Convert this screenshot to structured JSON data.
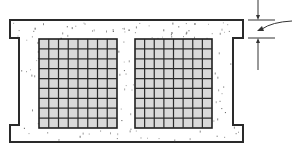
{
  "figure": {
    "title": "",
    "colors": {
      "outline": "#2a2a2a",
      "grid_fill": "#d9d9d9",
      "grid_lines": "#2b2b2b",
      "speckle": "#555555",
      "background": "#ffffff"
    },
    "outline": {
      "points": [
        [
          10,
          20
        ],
        [
          243,
          20
        ],
        [
          243,
          38
        ],
        [
          233,
          38
        ],
        [
          233,
          125
        ],
        [
          243,
          125
        ],
        [
          243,
          142
        ],
        [
          10,
          142
        ],
        [
          10,
          125
        ],
        [
          19,
          125
        ],
        [
          19,
          38
        ],
        [
          10,
          38
        ]
      ]
    },
    "grids": [
      {
        "id": "left-mesh",
        "x": 39,
        "y": 39,
        "width": 78,
        "height": 89,
        "cols": 8,
        "rows": 9
      },
      {
        "id": "right-mesh",
        "x": 135,
        "y": 39,
        "width": 77,
        "height": 89,
        "cols": 8,
        "rows": 9
      }
    ],
    "dimension": {
      "top_line_y": 20,
      "bottom_line_y": 38,
      "x_start": 248,
      "x_end": 275,
      "arrow_x": 258,
      "label": ""
    }
  }
}
